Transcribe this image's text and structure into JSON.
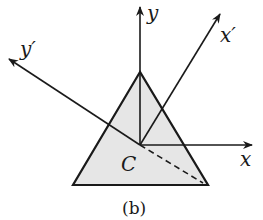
{
  "diagram": {
    "caption": "(b)",
    "labels": {
      "y": "y",
      "x": "x",
      "x_prime": "x′",
      "y_prime": "y′",
      "centroid": "C"
    },
    "colors": {
      "triangle_fill": "#e6e6e6",
      "stroke": "#1a1a1a"
    }
  }
}
